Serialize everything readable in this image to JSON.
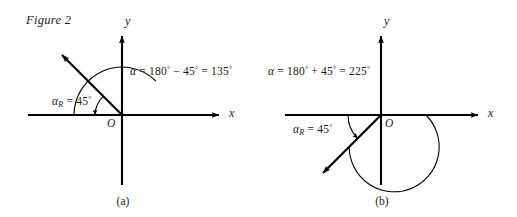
{
  "figure": {
    "title": "Figure 2",
    "background_color": "#ffffff",
    "ink_color": "#000000"
  },
  "panels": [
    {
      "id": "panel-a",
      "caption": "(a)",
      "axis_labels": {
        "x": "x",
        "y": "y"
      },
      "origin_label": "O",
      "angle_equation": {
        "symbol": "α",
        "equals": "=",
        "first_term": "180",
        "operator": "−",
        "second_term": "45",
        "result": "135",
        "degree": "°",
        "full_text": "α = 180° − 45° = 135°"
      },
      "reference_angle": {
        "symbol": "α",
        "subscript": "R",
        "equals": "=",
        "value": "45",
        "degree": "°",
        "full_text": "αR = 45°"
      },
      "terminal_angle_degrees": 135,
      "reference_angle_degrees": 45
    },
    {
      "id": "panel-b",
      "caption": "(b)",
      "axis_labels": {
        "x": "x",
        "y": "y"
      },
      "origin_label": "O",
      "angle_equation": {
        "symbol": "α",
        "equals": "=",
        "first_term": "180",
        "operator": "+",
        "second_term": "45",
        "result": "225",
        "degree": "°",
        "full_text": "α = 180° + 45° = 225°"
      },
      "reference_angle": {
        "symbol": "α",
        "subscript": "R",
        "equals": "=",
        "value": "45",
        "degree": "°",
        "full_text": "αR = 45°"
      },
      "terminal_angle_degrees": 225,
      "reference_angle_degrees": 45
    }
  ]
}
